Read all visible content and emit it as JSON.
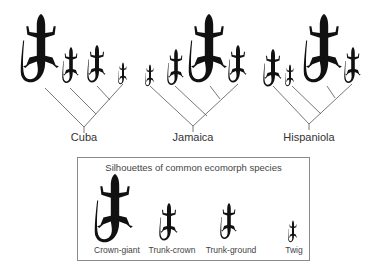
{
  "figure": {
    "islands": [
      {
        "name": "Cuba",
        "label_x": 84,
        "leaves": [
          {
            "ecomorph": "Crown-giant",
            "x": 42
          },
          {
            "ecomorph": "Trunk-ground",
            "x": 70
          },
          {
            "ecomorph": "Trunk-crown",
            "x": 97
          },
          {
            "ecomorph": "Twig",
            "x": 123
          }
        ]
      },
      {
        "name": "Jamaica",
        "label_x": 193,
        "leaves": [
          {
            "ecomorph": "Twig",
            "x": 150
          },
          {
            "ecomorph": "Trunk-ground",
            "x": 175
          },
          {
            "ecomorph": "Crown-giant",
            "x": 210
          },
          {
            "ecomorph": "Trunk-crown",
            "x": 238
          }
        ]
      },
      {
        "name": "Hispaniola",
        "label_x": 309,
        "leaves": [
          {
            "ecomorph": "Trunk-crown",
            "x": 273
          },
          {
            "ecomorph": "Twig",
            "x": 290
          },
          {
            "ecomorph": "Crown-giant",
            "x": 325
          },
          {
            "ecomorph": "Trunk-ground",
            "x": 352
          }
        ]
      }
    ],
    "legend": {
      "title": "Silhouettes of common ecomorph species",
      "items": [
        {
          "label": "Crown-giant",
          "x": 39
        },
        {
          "label": "Trunk-crown",
          "x": 94
        },
        {
          "label": "Trunk-ground",
          "x": 153
        },
        {
          "label": "Twig",
          "x": 216
        }
      ]
    },
    "colors": {
      "silhouette": "#111111",
      "branch": "#555555",
      "box_border": "#8a8a8a",
      "text": "#333333"
    }
  }
}
